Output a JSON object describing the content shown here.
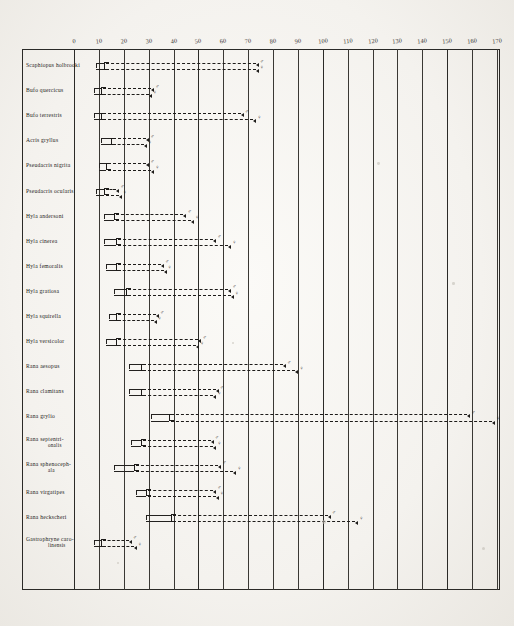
{
  "figure": {
    "title": "",
    "x_axis_label": "",
    "axis_min": 0,
    "axis_max": 170,
    "axis_step": 10,
    "tick_labels": [
      "0",
      "10",
      "20",
      "30",
      "40",
      "50",
      "60",
      "70",
      "80",
      "90",
      "100",
      "110",
      "120",
      "130",
      "140",
      "150",
      "160",
      "170"
    ],
    "male_symbol": "♂",
    "female_symbol": "♀"
  },
  "chart_data": {
    "type": "bar",
    "title": "",
    "xlabel": "",
    "ylabel": "",
    "xlim": [
      0,
      170
    ],
    "grid": true,
    "legend": [
      "♂",
      "♀"
    ],
    "legend_position": "inline-right-of-each-bar",
    "categories": [
      "Scaphiopus holbrooki",
      "Bufo quercicus",
      "Bufo terrestris",
      "Acris gryllus",
      "Pseudacris nigrita",
      "Pseudacris ocularis",
      "Hyla andersoni",
      "Hyla cinerea",
      "Hyla femoralis",
      "Hyla gratiosa",
      "Hyla squirella",
      "Hyla versicolor",
      "Rana aesopus",
      "Rana clamitans",
      "Rana grylio",
      "Rana septentrionalis",
      "Rana sphenocephala",
      "Rana virgatipes",
      "Rana heckscheri",
      "Gastrophryne carolinensis"
    ],
    "category_second_lines": {
      "Rana septentrionalis": "onalis",
      "Rana sphenocephala": "ala",
      "Gastrophryne carolinensis": "linensis"
    },
    "category_first_lines": {
      "Rana septentrionalis": "Rana septentri-",
      "Rana sphenocephala": "Rana sphenoceph-",
      "Gastrophryne carolinensis": "Gastrophryne caro-"
    },
    "series": [
      {
        "name": "♂",
        "ranges": [
          {
            "min": 9,
            "box_start": 12,
            "max": 73
          },
          {
            "min": 8,
            "box_start": 11,
            "max": 31
          },
          {
            "min": 8,
            "box_start": 11,
            "max": 67
          },
          {
            "min": 11,
            "box_start": 15,
            "max": 29
          },
          {
            "min": 10,
            "box_start": 13,
            "max": 29
          },
          {
            "min": 9,
            "box_start": 12,
            "max": 17
          },
          {
            "min": 12,
            "box_start": 16,
            "max": 44
          },
          {
            "min": 12,
            "box_start": 17,
            "max": 56
          },
          {
            "min": 13,
            "box_start": 17,
            "max": 35
          },
          {
            "min": 16,
            "box_start": 21,
            "max": 62
          },
          {
            "min": 14,
            "box_start": 17,
            "max": 33
          },
          {
            "min": 13,
            "box_start": 17,
            "max": 50
          },
          {
            "min": 22,
            "box_start": 27,
            "max": 84
          },
          {
            "min": 22,
            "box_start": 27,
            "max": 57
          },
          {
            "min": 31,
            "box_start": 38,
            "max": 158
          },
          {
            "min": 23,
            "box_start": 27,
            "max": 55
          },
          {
            "min": 16,
            "box_start": 24,
            "max": 58
          },
          {
            "min": 25,
            "box_start": 29,
            "max": 56
          },
          {
            "min": 29,
            "box_start": 39,
            "max": 102
          },
          {
            "min": 8,
            "box_start": 11,
            "max": 22
          }
        ]
      },
      {
        "name": "♀",
        "ranges": [
          {
            "min": 9,
            "box_start": 12,
            "max": 73
          },
          {
            "min": 8,
            "box_start": 11,
            "max": 30
          },
          {
            "min": 8,
            "box_start": 11,
            "max": 72
          },
          {
            "min": 11,
            "box_start": 15,
            "max": 28
          },
          {
            "min": 10,
            "box_start": 13,
            "max": 31
          },
          {
            "min": 9,
            "box_start": 12,
            "max": 18
          },
          {
            "min": 12,
            "box_start": 16,
            "max": 47
          },
          {
            "min": 12,
            "box_start": 17,
            "max": 62
          },
          {
            "min": 13,
            "box_start": 17,
            "max": 36
          },
          {
            "min": 16,
            "box_start": 21,
            "max": 63
          },
          {
            "min": 14,
            "box_start": 17,
            "max": 32
          },
          {
            "min": 13,
            "box_start": 17,
            "max": 49
          },
          {
            "min": 22,
            "box_start": 27,
            "max": 89
          },
          {
            "min": 22,
            "box_start": 27,
            "max": 56
          },
          {
            "min": 31,
            "box_start": 38,
            "max": 168
          },
          {
            "min": 23,
            "box_start": 27,
            "max": 56
          },
          {
            "min": 16,
            "box_start": 24,
            "max": 64
          },
          {
            "min": 25,
            "box_start": 29,
            "max": 57
          },
          {
            "min": 29,
            "box_start": 39,
            "max": 113
          },
          {
            "min": 8,
            "box_start": 11,
            "max": 24
          }
        ]
      }
    ]
  }
}
